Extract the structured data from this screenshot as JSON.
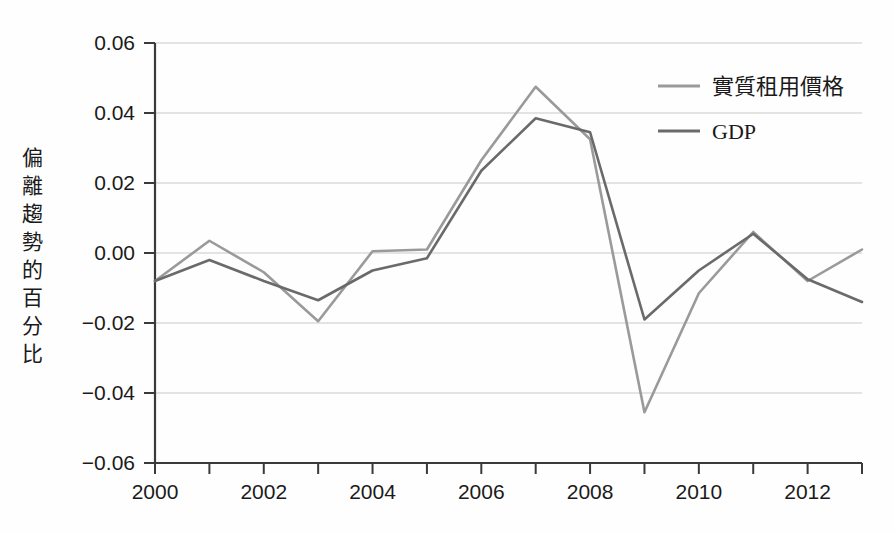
{
  "chart_data": {
    "type": "line",
    "title": "",
    "xlabel": "",
    "ylabel": "偏離趨勢的百分比",
    "x": [
      2000,
      2001,
      2002,
      2003,
      2004,
      2005,
      2006,
      2007,
      2008,
      2009,
      2010,
      2011,
      2012,
      2013
    ],
    "xlim": [
      2000,
      2013
    ],
    "ylim": [
      -0.06,
      0.06
    ],
    "x_tick_labels": [
      "2000",
      "2002",
      "2004",
      "2006",
      "2008",
      "2010",
      "2012"
    ],
    "x_tick_values": [
      2000,
      2002,
      2004,
      2006,
      2008,
      2010,
      2012
    ],
    "y_tick_labels": [
      "0.06",
      "0.04",
      "0.02",
      "0.00",
      "−0.02",
      "−0.04",
      "−0.06"
    ],
    "y_tick_values": [
      0.06,
      0.04,
      0.02,
      0.0,
      -0.02,
      -0.04,
      -0.06
    ],
    "grid": true,
    "legend_position": "top-right",
    "series": [
      {
        "name": "實質租用價格",
        "color": "#9a9a9a",
        "values": [
          -0.008,
          0.0035,
          -0.0055,
          -0.0195,
          0.0005,
          0.001,
          0.0265,
          0.0475,
          0.0325,
          -0.0455,
          -0.0115,
          0.006,
          -0.008,
          0.001
        ]
      },
      {
        "name": "GDP",
        "color": "#6a6a6a",
        "values": [
          -0.008,
          -0.002,
          -0.008,
          -0.0135,
          -0.005,
          -0.0015,
          0.0235,
          0.0385,
          0.0345,
          -0.019,
          -0.005,
          0.0055,
          -0.0075,
          -0.014
        ]
      }
    ]
  },
  "legend": {
    "items": [
      {
        "label": "實質租用價格",
        "color": "#9a9a9a"
      },
      {
        "label": "GDP",
        "color": "#6a6a6a"
      }
    ]
  },
  "axis": {
    "y_label_chars": [
      "偏",
      "離",
      "趨",
      "勢",
      "的",
      "百",
      "分",
      "比"
    ]
  }
}
